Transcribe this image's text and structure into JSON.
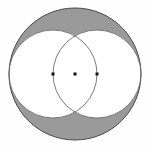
{
  "figure": {
    "canvas": {
      "width": 148,
      "height": 152,
      "background_color": "#fefefe"
    },
    "colors": {
      "shaded_fill": "#9a9a9a",
      "unshaded_fill": "#ffffff",
      "stroke": "#4a4a4a",
      "inner_stroke": "#6a6a6a",
      "dot_fill": "#111111"
    },
    "stroke_width": 1,
    "inner_stroke_width": 0.9,
    "outer_circle": {
      "label": "outer-circle",
      "cx": 75,
      "cy": 74,
      "r": 66
    },
    "inner_circles": [
      {
        "label": "left-inner-circle",
        "cx": 53,
        "cy": 74,
        "r": 44
      },
      {
        "label": "right-inner-circle",
        "cx": 97,
        "cy": 74,
        "r": 44
      }
    ],
    "dots": [
      {
        "label": "left-center-point",
        "cx": 53,
        "cy": 74,
        "size": 3
      },
      {
        "label": "figure-center-point",
        "cx": 75,
        "cy": 74,
        "size": 3
      },
      {
        "label": "right-center-point",
        "cx": 97,
        "cy": 74,
        "size": 3
      }
    ],
    "intersections": [
      {
        "label": "top-intersection",
        "x": 75,
        "y": 30
      },
      {
        "label": "bottom-intersection",
        "x": 75,
        "y": 118
      }
    ],
    "shaded_regions": [
      {
        "label": "top-lune",
        "description": "region inside outer circle and outside both inner circles, above"
      },
      {
        "label": "bottom-lune",
        "description": "region inside outer circle and outside both inner circles, below"
      }
    ]
  }
}
